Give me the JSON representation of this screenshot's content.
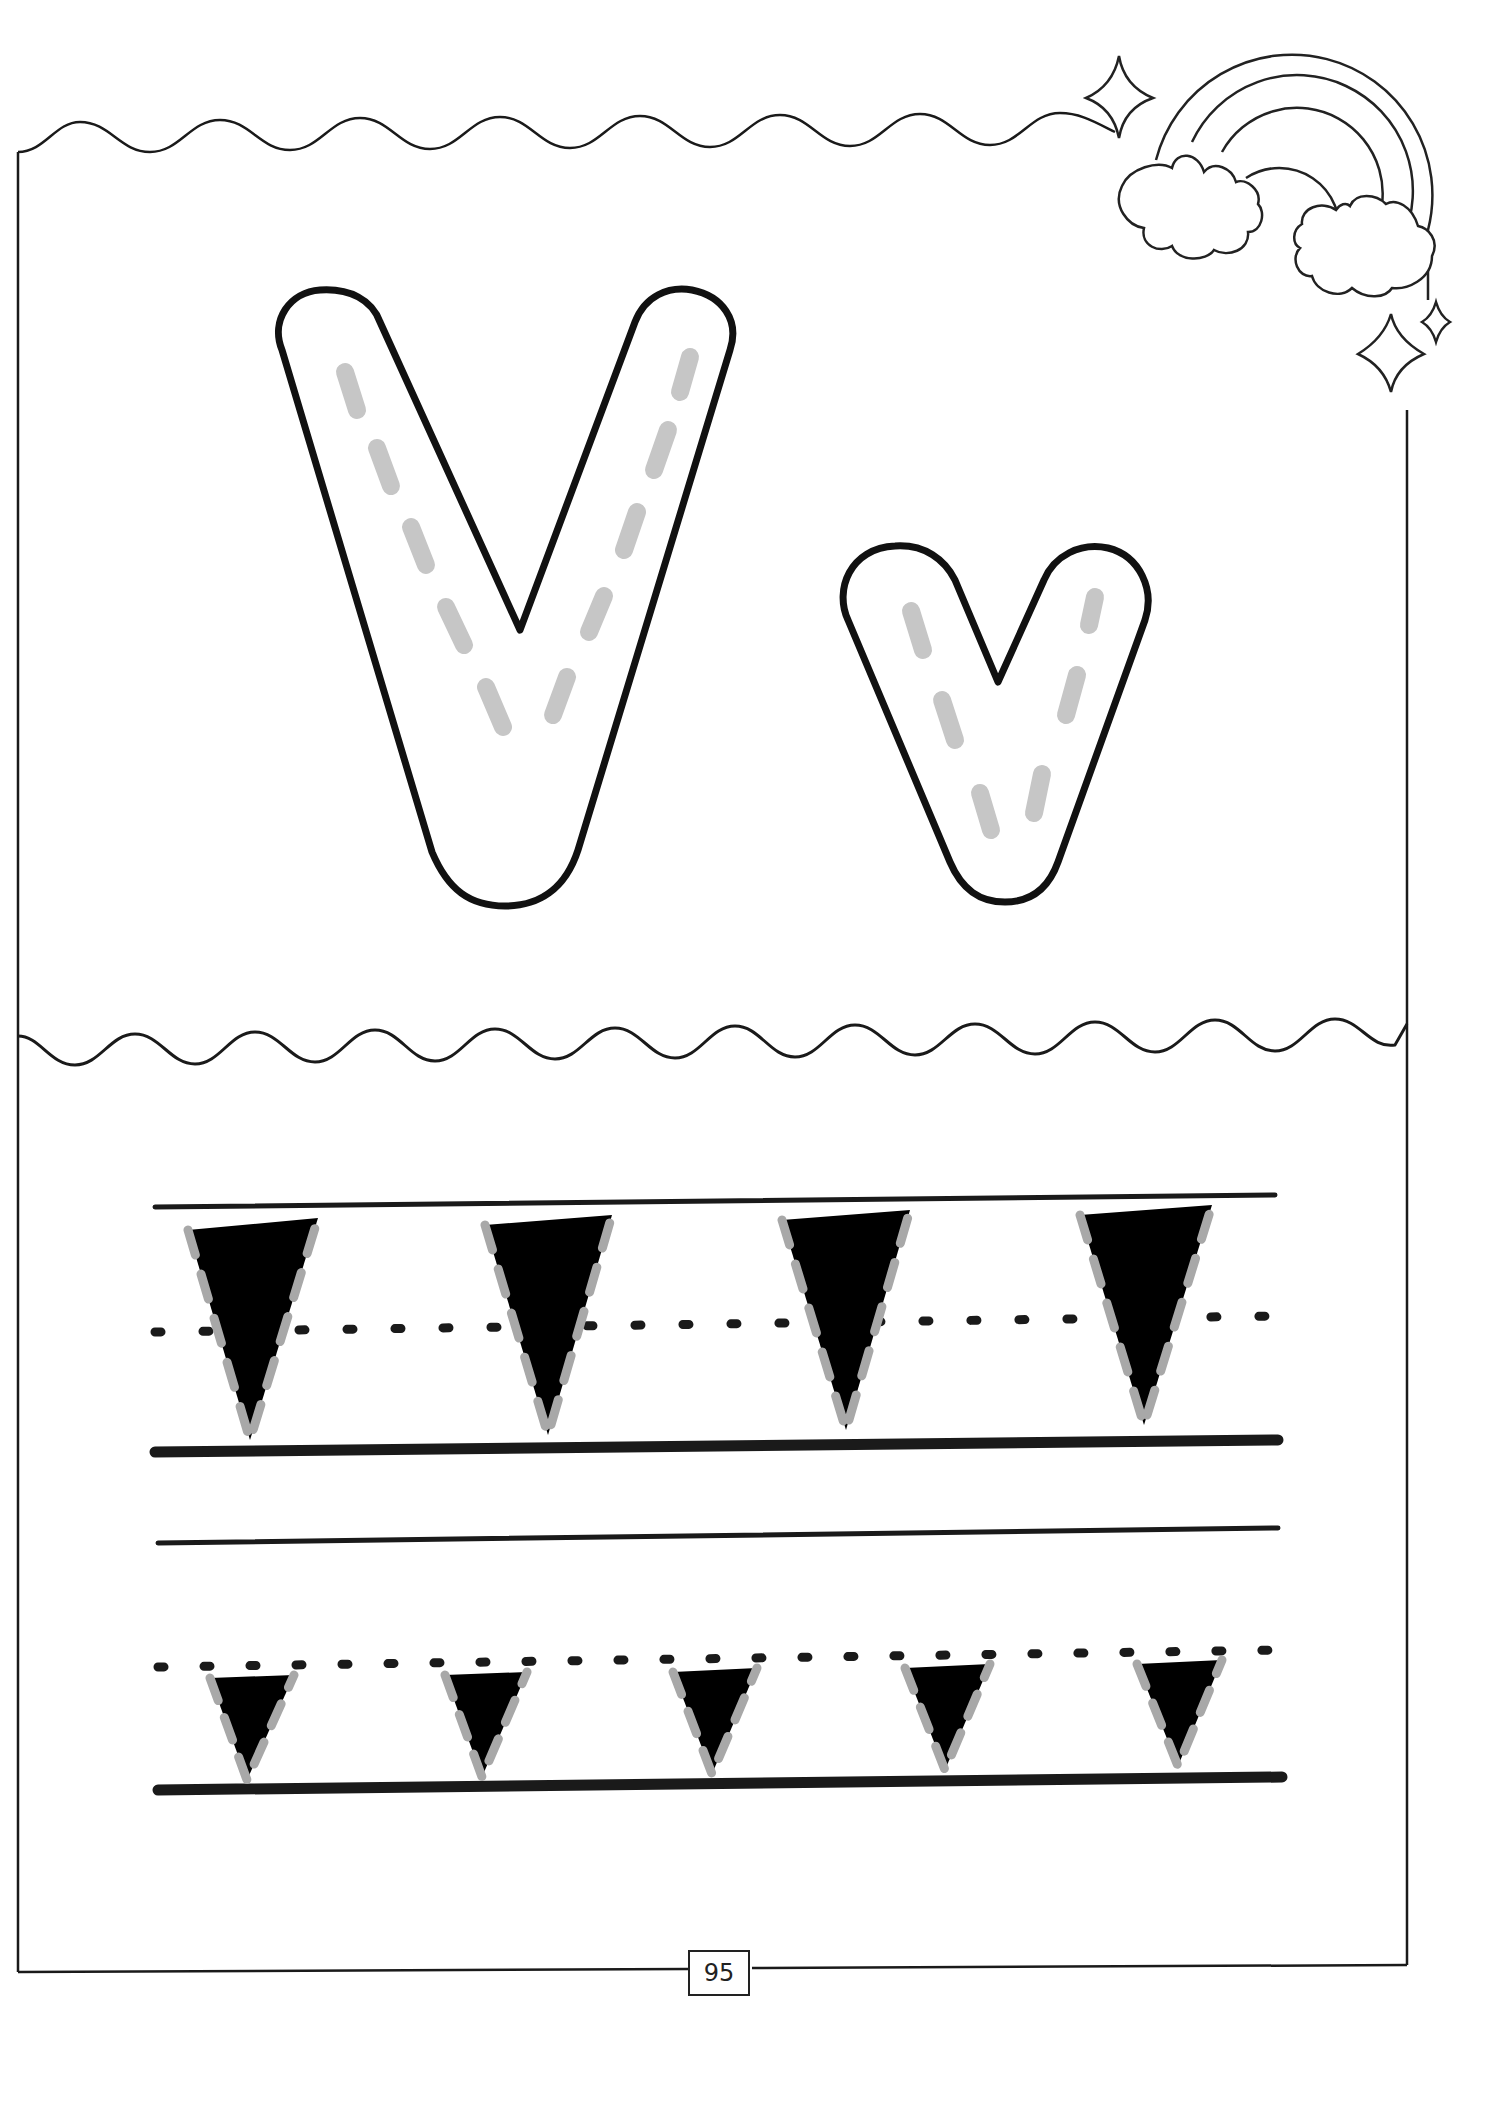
{
  "page": {
    "letter_upper": "V",
    "letter_lower": "v",
    "page_number": "95",
    "colors": {
      "outline": "#1a1a1a",
      "trace_dash": "#a8a8a8",
      "big_letter_dash": "#c8c8c8",
      "background": "#ffffff"
    }
  },
  "practice": {
    "uppercase_row": {
      "letter": "V",
      "count": 4
    },
    "lowercase_row": {
      "letter": "v",
      "count": 5
    }
  },
  "decorations": [
    "rainbow-icon",
    "cloud-icon",
    "cloud-icon",
    "sparkle-icon",
    "sparkle-icon",
    "sparkle-icon"
  ]
}
